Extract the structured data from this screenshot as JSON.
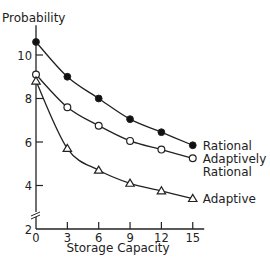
{
  "chart_data": {
    "type": "line",
    "title": "",
    "xlabel": "Storage Capacity",
    "ylabel": "Probability",
    "x": [
      0,
      3,
      6,
      9,
      12,
      15
    ],
    "x_ticks": [
      "0",
      "3",
      "6",
      "9",
      "12",
      "15"
    ],
    "y_ticks": [
      "2",
      "4",
      "6",
      "8",
      "10"
    ],
    "xlim": [
      0,
      16
    ],
    "ylim": [
      2,
      11
    ],
    "y_axis_break": true,
    "grid": false,
    "legend": "inline-right",
    "series": [
      {
        "name": "Rational",
        "label_lines": [
          "Rational"
        ],
        "marker": "filled-circle",
        "values": [
          10.6,
          9.0,
          8.0,
          7.05,
          6.45,
          5.85
        ]
      },
      {
        "name": "Adaptively Rational",
        "label_lines": [
          "Adaptively",
          "Rational"
        ],
        "marker": "open-circle",
        "values": [
          9.1,
          7.6,
          6.75,
          6.05,
          5.65,
          5.25
        ]
      },
      {
        "name": "Adaptive",
        "label_lines": [
          "Adaptive"
        ],
        "marker": "open-triangle",
        "values": [
          8.8,
          5.7,
          4.7,
          4.1,
          3.75,
          3.4
        ]
      }
    ]
  }
}
